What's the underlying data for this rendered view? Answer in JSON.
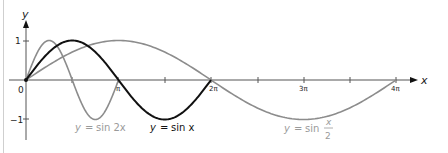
{
  "chart_data": {
    "type": "line",
    "title": "",
    "xlabel": "x",
    "ylabel": "y",
    "x_ticks": [
      {
        "value": 0,
        "label": "0"
      },
      {
        "value": 3.14159,
        "label": "π"
      },
      {
        "value": 6.28318,
        "label": "2π"
      },
      {
        "value": 9.42478,
        "label": "3π"
      },
      {
        "value": 12.56637,
        "label": "4π"
      }
    ],
    "y_ticks": [
      {
        "value": 1,
        "label": "1"
      },
      {
        "value": -1,
        "label": "−1"
      }
    ],
    "xlim": [
      0,
      12.566
    ],
    "ylim": [
      -1,
      1
    ],
    "grid": false,
    "series": [
      {
        "name": "y = sin 2x",
        "function": "sin(2x)",
        "domain": [
          0,
          3.14159
        ],
        "color": "#8c8c8c",
        "label_parts": {
          "lhs": "y",
          "rhs": "sin 2x"
        }
      },
      {
        "name": "y = sin x",
        "function": "sin(x)",
        "domain": [
          0,
          6.28318
        ],
        "color": "#111111",
        "label_parts": {
          "lhs": "y",
          "rhs": "sin x"
        }
      },
      {
        "name": "y = sin x/2",
        "function": "sin(x/2)",
        "domain": [
          0,
          12.56637
        ],
        "color": "#8c8c8c",
        "label_parts": {
          "lhs": "y",
          "rhs": "sin",
          "num": "x",
          "den": "2"
        }
      }
    ]
  },
  "labels": {
    "y_axis": "y",
    "x_axis": "x",
    "origin": "0",
    "pi": "π",
    "two_pi": "2π",
    "three_pi": "3π",
    "four_pi": "4π",
    "one": "1",
    "minus_one": "−1",
    "sin2x_y": "y",
    "sin2x_eq": "=",
    "sin2x_rhs": "sin 2x",
    "sinx_y": "y",
    "sinx_eq": "=",
    "sinx_rhs": "sin x",
    "sinhalf_y": "y",
    "sinhalf_eq": "=",
    "sinhalf_sin": "sin",
    "sinhalf_num": "x",
    "sinhalf_den": "2"
  }
}
